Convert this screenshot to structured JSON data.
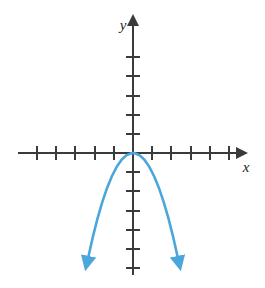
{
  "figure": {
    "name": "downward-parabola-graph",
    "width": 265,
    "height": 288,
    "background_color": "#ffffff"
  },
  "axes": {
    "x_axis": {
      "label": "x",
      "color": "#3b3b3b",
      "has_arrow_right": true,
      "has_arrow_left": false,
      "tick_count_left": 5,
      "tick_count_right": 5,
      "tick_spacing_px": 19.2
    },
    "y_axis": {
      "label": "y",
      "color": "#3b3b3b",
      "has_arrow_up": true,
      "has_arrow_down": false,
      "tick_count_above": 5,
      "tick_count_below": 6,
      "tick_spacing_px": 19.2
    },
    "origin_px": {
      "x": 133,
      "y": 153
    }
  },
  "chart_data": {
    "type": "line",
    "title": "",
    "xlabel": "x",
    "ylabel": "y",
    "grid": false,
    "legend": null,
    "curve_color": "#4ba6dc",
    "curve_width_px": 2.6,
    "equation": "y = -x^2",
    "vertex": [
      0,
      0
    ],
    "opens": "down",
    "axis_of_symmetry": "x = 0",
    "xlim": [
      -6,
      6
    ],
    "ylim": [
      -6.5,
      5.5
    ],
    "xticks": [
      -5,
      -4,
      -3,
      -2,
      -1,
      1,
      2,
      3,
      4,
      5
    ],
    "yticks": [
      -6,
      -5,
      -4,
      -3,
      -2,
      -1,
      1,
      2,
      3,
      4,
      5
    ],
    "x": [
      -2.35,
      -2.1,
      -1.85,
      -1.6,
      -1.35,
      -1.1,
      -0.85,
      -0.6,
      -0.35,
      -0.1,
      0,
      0.1,
      0.35,
      0.6,
      0.85,
      1.1,
      1.35,
      1.6,
      1.85,
      2.1,
      2.35
    ],
    "y": [
      -5.52,
      -4.41,
      -3.42,
      -2.56,
      -1.82,
      -1.21,
      -0.72,
      -0.36,
      -0.12,
      -0.01,
      0,
      -0.01,
      -0.12,
      -0.36,
      -0.72,
      -1.21,
      -1.82,
      -2.56,
      -3.42,
      -4.41,
      -5.52
    ],
    "arrowheads": [
      {
        "position": "left-end",
        "at": [
          -2.35,
          -5.52
        ]
      },
      {
        "position": "right-end",
        "at": [
          2.35,
          -5.52
        ]
      }
    ]
  }
}
